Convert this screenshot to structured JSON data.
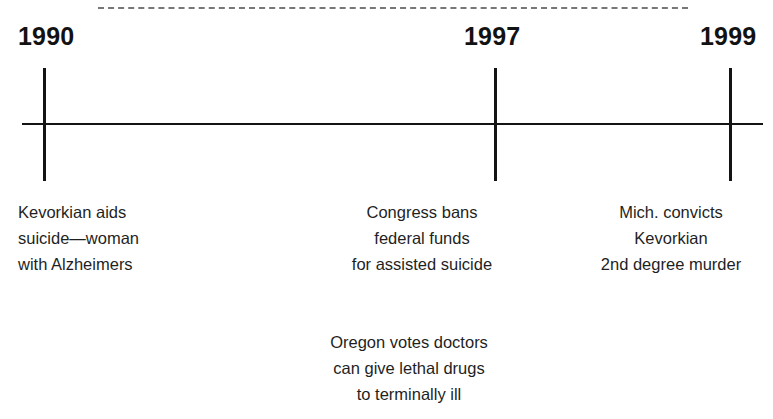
{
  "figure": {
    "type": "timeline",
    "title": "",
    "axis": {
      "orientation": "horizontal",
      "ticks": [
        {
          "year": "1990",
          "x": 43
        },
        {
          "year": "1997",
          "x": 494
        },
        {
          "year": "1999",
          "x": 729
        }
      ]
    },
    "top_rule": {
      "style": "dashed",
      "color": "#777777"
    },
    "events": [
      {
        "id": "event-1990",
        "year": "1990",
        "align": "left",
        "lines": [
          "Kevorkian aids",
          "suicide—woman",
          "with Alzheimers"
        ]
      },
      {
        "id": "event-1997-congress",
        "year": "1997",
        "align": "center",
        "lines": [
          "Congress bans",
          "federal funds",
          "for assisted suicide"
        ]
      },
      {
        "id": "event-1999",
        "year": "1999",
        "align": "center",
        "lines": [
          "Mich. convicts",
          "Kevorkian",
          "2nd degree murder"
        ]
      },
      {
        "id": "event-1997-oregon",
        "year": "1997",
        "align": "center",
        "lines": [
          "Oregon votes doctors",
          "can give lethal drugs",
          "to terminally ill"
        ]
      }
    ],
    "colors": {
      "ink": "#141414",
      "text": "#1f1f1f",
      "dash": "#777777",
      "background": "#ffffff"
    }
  }
}
